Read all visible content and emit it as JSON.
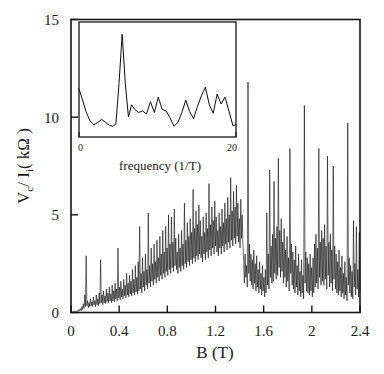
{
  "figure": {
    "background_color": "#ffffff",
    "line_color": "#0d0d0d",
    "axis_color": "#141414"
  },
  "chart_data": {
    "type": "line",
    "title": "",
    "xlabel": "B (T)",
    "ylabel": "V_c / I_i (kOhm)",
    "ylabel_parts": {
      "v": "V",
      "v_sub": "c",
      "slash": "/ I",
      "i_sub": "i",
      "unit_open": "( k",
      "omega": "Ω",
      "unit_close": " )"
    },
    "xlim": [
      0,
      2.4
    ],
    "ylim": [
      0,
      15
    ],
    "xticks": [
      0,
      0.4,
      0.8,
      1.2,
      1.6,
      2,
      2.4
    ],
    "xticklabels": [
      "0",
      "0.4",
      "0.8",
      "1.2",
      "1.6",
      "2",
      "2.4"
    ],
    "yticks": [
      0,
      5,
      10,
      15
    ],
    "yticklabels": [
      "0",
      "5",
      "10",
      "15"
    ],
    "grid": false,
    "legend": null,
    "x": [
      0.0,
      0.006,
      0.012,
      0.018,
      0.024,
      0.03,
      0.036,
      0.042,
      0.048,
      0.054,
      0.06,
      0.066,
      0.072,
      0.078,
      0.084,
      0.09,
      0.096,
      0.102,
      0.108,
      0.114,
      0.12,
      0.126,
      0.132,
      0.138,
      0.144,
      0.15,
      0.156,
      0.162,
      0.168,
      0.174,
      0.18,
      0.186,
      0.192,
      0.198,
      0.204,
      0.21,
      0.216,
      0.222,
      0.228,
      0.234,
      0.24,
      0.246,
      0.252,
      0.258,
      0.264,
      0.27,
      0.276,
      0.282,
      0.288,
      0.294,
      0.3,
      0.306,
      0.312,
      0.318,
      0.324,
      0.33,
      0.336,
      0.342,
      0.348,
      0.354,
      0.36,
      0.366,
      0.372,
      0.378,
      0.384,
      0.39,
      0.396,
      0.402,
      0.408,
      0.414,
      0.42,
      0.426,
      0.432,
      0.438,
      0.444,
      0.45,
      0.456,
      0.462,
      0.468,
      0.474,
      0.48,
      0.486,
      0.492,
      0.498,
      0.504,
      0.51,
      0.516,
      0.522,
      0.528,
      0.534,
      0.54,
      0.546,
      0.552,
      0.558,
      0.564,
      0.57,
      0.576,
      0.582,
      0.588,
      0.594,
      0.6,
      0.606,
      0.612,
      0.618,
      0.624,
      0.63,
      0.636,
      0.642,
      0.648,
      0.654,
      0.66,
      0.666,
      0.672,
      0.678,
      0.684,
      0.69,
      0.696,
      0.702,
      0.708,
      0.714,
      0.72,
      0.726,
      0.732,
      0.738,
      0.744,
      0.75,
      0.756,
      0.762,
      0.768,
      0.774,
      0.78,
      0.786,
      0.792,
      0.798,
      0.804,
      0.81,
      0.816,
      0.822,
      0.828,
      0.834,
      0.84,
      0.846,
      0.852,
      0.858,
      0.864,
      0.87,
      0.876,
      0.882,
      0.888,
      0.894,
      0.9,
      0.906,
      0.912,
      0.918,
      0.924,
      0.93,
      0.936,
      0.942,
      0.948,
      0.954,
      0.96,
      0.966,
      0.972,
      0.978,
      0.984,
      0.99,
      0.996,
      1.002,
      1.008,
      1.014,
      1.02,
      1.026,
      1.032,
      1.038,
      1.044,
      1.05,
      1.056,
      1.062,
      1.068,
      1.074,
      1.08,
      1.086,
      1.092,
      1.098,
      1.104,
      1.11,
      1.116,
      1.122,
      1.128,
      1.134,
      1.14,
      1.146,
      1.152,
      1.158,
      1.164,
      1.17,
      1.176,
      1.182,
      1.188,
      1.194,
      1.2,
      1.206,
      1.212,
      1.218,
      1.224,
      1.23,
      1.236,
      1.242,
      1.248,
      1.254,
      1.26,
      1.266,
      1.272,
      1.278,
      1.284,
      1.29,
      1.296,
      1.302,
      1.308,
      1.314,
      1.32,
      1.326,
      1.332,
      1.338,
      1.344,
      1.35,
      1.356,
      1.362,
      1.368,
      1.374,
      1.38,
      1.386,
      1.392,
      1.398,
      1.404,
      1.41,
      1.416,
      1.422,
      1.428,
      1.434,
      1.44,
      1.446,
      1.452,
      1.458,
      1.464,
      1.47,
      1.476,
      1.482,
      1.488,
      1.494,
      1.5,
      1.506,
      1.512,
      1.518,
      1.524,
      1.53,
      1.536,
      1.542,
      1.548,
      1.554,
      1.56,
      1.566,
      1.572,
      1.578,
      1.584,
      1.59,
      1.596,
      1.602,
      1.608,
      1.614,
      1.62,
      1.626,
      1.632,
      1.638,
      1.644,
      1.65,
      1.656,
      1.662,
      1.668,
      1.674,
      1.68,
      1.686,
      1.692,
      1.698,
      1.704,
      1.71,
      1.716,
      1.722,
      1.728,
      1.734,
      1.74,
      1.746,
      1.752,
      1.758,
      1.764,
      1.77,
      1.776,
      1.782,
      1.788,
      1.794,
      1.8,
      1.806,
      1.812,
      1.818,
      1.824,
      1.83,
      1.836,
      1.842,
      1.848,
      1.854,
      1.86,
      1.866,
      1.872,
      1.878,
      1.884,
      1.89,
      1.896,
      1.902,
      1.908,
      1.914,
      1.92,
      1.926,
      1.932,
      1.938,
      1.944,
      1.95,
      1.956,
      1.962,
      1.968,
      1.974,
      1.98,
      1.986,
      1.992,
      1.998,
      2.004,
      2.01,
      2.016,
      2.022,
      2.028,
      2.034,
      2.04,
      2.046,
      2.052,
      2.058,
      2.064,
      2.07,
      2.076,
      2.082,
      2.088,
      2.094,
      2.1,
      2.106,
      2.112,
      2.118,
      2.124,
      2.13,
      2.136,
      2.142,
      2.148,
      2.154,
      2.16,
      2.166,
      2.172,
      2.178,
      2.184,
      2.19,
      2.196,
      2.202,
      2.208,
      2.214,
      2.22,
      2.226,
      2.232,
      2.238,
      2.244,
      2.25,
      2.256,
      2.262,
      2.268,
      2.274,
      2.28,
      2.286,
      2.292,
      2.298,
      2.304,
      2.31,
      2.316,
      2.322,
      2.328,
      2.334,
      2.34,
      2.346,
      2.352,
      2.358,
      2.364,
      2.37,
      2.376,
      2.382,
      2.388,
      2.394,
      2.4
    ],
    "y": [
      0.02,
      0.03,
      0.02,
      0.05,
      0.03,
      0.06,
      0.04,
      0.08,
      0.05,
      0.1,
      0.06,
      0.15,
      0.08,
      0.2,
      0.1,
      0.3,
      0.15,
      0.45,
      0.2,
      0.9,
      0.3,
      2.9,
      0.35,
      0.6,
      0.25,
      0.5,
      0.3,
      0.7,
      0.35,
      0.55,
      0.3,
      0.8,
      0.4,
      0.6,
      0.3,
      0.9,
      0.4,
      0.7,
      0.35,
      1.0,
      0.45,
      2.7,
      0.5,
      0.9,
      0.4,
      1.1,
      0.5,
      0.85,
      0.45,
      1.2,
      0.55,
      1.0,
      0.5,
      1.3,
      0.6,
      0.95,
      0.5,
      1.4,
      0.6,
      1.1,
      0.55,
      1.5,
      0.7,
      1.2,
      0.6,
      3.3,
      0.75,
      1.3,
      0.65,
      1.6,
      0.8,
      1.2,
      0.7,
      1.7,
      0.85,
      1.4,
      0.75,
      2.0,
      0.9,
      1.5,
      0.8,
      1.9,
      0.95,
      1.6,
      0.85,
      2.2,
      1.0,
      1.7,
      0.9,
      2.4,
      1.05,
      1.8,
      0.95,
      2.6,
      1.1,
      4.4,
      1.2,
      2.0,
      1.0,
      2.8,
      1.3,
      2.1,
      1.1,
      3.0,
      1.4,
      2.2,
      1.2,
      5.1,
      1.5,
      2.4,
      1.3,
      3.3,
      1.6,
      2.5,
      1.4,
      3.5,
      1.7,
      2.6,
      1.5,
      3.7,
      1.8,
      2.8,
      1.6,
      3.9,
      1.9,
      3.0,
      1.7,
      4.2,
      2.0,
      3.1,
      1.8,
      4.4,
      2.1,
      3.3,
      1.9,
      5.0,
      2.2,
      3.5,
      2.0,
      4.9,
      2.3,
      3.6,
      2.1,
      5.3,
      2.4,
      3.8,
      2.2,
      3.1,
      2.0,
      4.0,
      2.3,
      3.3,
      2.1,
      4.2,
      2.4,
      3.5,
      2.2,
      5.6,
      2.5,
      3.7,
      2.3,
      4.6,
      2.6,
      3.9,
      2.4,
      4.8,
      2.7,
      4.1,
      2.5,
      6.3,
      2.8,
      4.3,
      2.6,
      5.2,
      2.9,
      4.5,
      2.7,
      5.5,
      3.0,
      4.7,
      2.8,
      3.9,
      2.6,
      4.9,
      3.0,
      4.1,
      2.7,
      5.1,
      3.1,
      4.3,
      2.8,
      6.6,
      3.2,
      4.5,
      2.9,
      5.4,
      3.3,
      4.7,
      3.0,
      5.7,
      3.4,
      4.9,
      3.1,
      4.2,
      2.9,
      5.1,
      3.3,
      4.4,
      3.0,
      5.3,
      3.4,
      4.6,
      3.1,
      5.6,
      3.5,
      4.8,
      3.2,
      5.9,
      3.6,
      5.0,
      3.3,
      6.9,
      3.7,
      5.2,
      3.4,
      6.2,
      3.8,
      5.4,
      3.5,
      6.5,
      3.9,
      5.6,
      3.6,
      4.8,
      3.3,
      5.8,
      3.8,
      5.0,
      3.4,
      2.6,
      1.5,
      3.0,
      1.8,
      2.4,
      1.3,
      11.8,
      2.0,
      3.5,
      1.6,
      3.0,
      1.4,
      2.7,
      1.2,
      3.2,
      1.5,
      2.5,
      1.1,
      2.9,
      1.3,
      2.2,
      1.0,
      2.6,
      1.2,
      2.0,
      0.9,
      2.4,
      1.1,
      1.8,
      0.8,
      2.2,
      1.0,
      5.1,
      1.4,
      3.0,
      1.2,
      7.3,
      1.8,
      3.4,
      1.5,
      4.0,
      1.6,
      6.7,
      2.0,
      3.8,
      1.7,
      4.4,
      1.9,
      7.9,
      2.3,
      4.2,
      1.8,
      4.8,
      2.1,
      3.6,
      1.5,
      4.3,
      1.8,
      3.2,
      1.3,
      3.9,
      1.6,
      2.8,
      1.1,
      8.4,
      2.0,
      3.5,
      1.4,
      3.1,
      1.2,
      2.7,
      1.0,
      3.4,
      1.3,
      2.4,
      0.9,
      3.0,
      1.1,
      2.1,
      0.8,
      2.7,
      1.0,
      1.9,
      0.7,
      10.6,
      1.5,
      3.1,
      1.1,
      2.8,
      1.0,
      2.5,
      0.9,
      3.0,
      1.1,
      2.3,
      0.8,
      2.8,
      1.0,
      3.5,
      1.3,
      4.0,
      1.5,
      3.3,
      1.2,
      8.4,
      1.8,
      3.6,
      1.4,
      4.2,
      1.6,
      3.8,
      1.4,
      4.5,
      1.7,
      3.4,
      1.2,
      8.0,
      1.9,
      3.6,
      1.3,
      4.0,
      1.5,
      3.2,
      1.1,
      7.5,
      1.7,
      3.4,
      1.2,
      3.0,
      1.0,
      2.6,
      0.9,
      3.2,
      1.1,
      2.3,
      0.8,
      2.9,
      1.0,
      2.0,
      0.7,
      2.6,
      0.9,
      1.8,
      0.6,
      9.7,
      1.4,
      2.8,
      1.0,
      2.4,
      0.8,
      2.1,
      0.7,
      4.7,
      1.3,
      2.5,
      0.9,
      4.4,
      1.2,
      2.2,
      0.8,
      4.1,
      1.1,
      1.9,
      0.7,
      3.8,
      1.0,
      1.7,
      0.6,
      11.2,
      1.5,
      2.6,
      0.9,
      2.3,
      0.8,
      2.0,
      0.7,
      2.8,
      1.0,
      1.8,
      0.6,
      2.5,
      0.9,
      2.3,
      0.8,
      2.0,
      0.7,
      2.2,
      0.5
    ]
  },
  "inset_chart_data": {
    "type": "line",
    "title": "",
    "xlabel": "frequency (1/T)",
    "ylabel": "",
    "xlim": [
      0,
      20
    ],
    "ylim": [
      0,
      15
    ],
    "xticks": [
      0,
      20
    ],
    "xticklabels": [
      "0",
      "20"
    ],
    "grid": false,
    "description": "Fourier power spectrum of the conductance fluctuations showing a single dominant peak near 5.5 (1/T).",
    "x": [
      0.0,
      0.4,
      0.9,
      1.4,
      1.9,
      2.4,
      2.9,
      3.4,
      3.9,
      4.3,
      4.7,
      5.1,
      5.5,
      5.9,
      6.3,
      6.7,
      7.1,
      7.6,
      8.1,
      8.6,
      9.1,
      9.6,
      10.1,
      10.6,
      11.1,
      11.6,
      12.1,
      12.6,
      13.1,
      13.6,
      14.1,
      14.6,
      15.1,
      15.6,
      16.1,
      16.6,
      17.1,
      17.6,
      18.1,
      18.6,
      19.1,
      19.6,
      20.0
    ],
    "y": [
      6.3,
      5.0,
      3.3,
      2.1,
      1.6,
      1.9,
      2.3,
      1.9,
      1.5,
      1.4,
      1.7,
      7.0,
      13.4,
      7.0,
      2.6,
      4.2,
      3.6,
      3.2,
      3.4,
      3.0,
      4.6,
      3.2,
      5.2,
      3.6,
      3.4,
      2.5,
      1.4,
      1.9,
      3.2,
      4.8,
      3.3,
      2.4,
      4.0,
      5.4,
      6.5,
      4.2,
      3.1,
      5.6,
      4.3,
      5.2,
      3.4,
      1.5,
      1.6
    ]
  }
}
